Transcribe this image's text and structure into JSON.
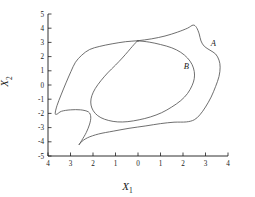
{
  "chart_data": {
    "type": "line",
    "title": "",
    "xlabel": "X1",
    "ylabel": "X2",
    "x_axis_label_text": "X",
    "x_axis_label_sub": "1",
    "y_axis_label_text": "X",
    "y_axis_label_sub": "2",
    "grid": false,
    "legend_position": "none",
    "xlim": [
      4,
      -4
    ],
    "ylim": [
      -5,
      5
    ],
    "x_reversed": true,
    "xticks": [
      4,
      3,
      2,
      1,
      0,
      1,
      2,
      3,
      4
    ],
    "xtick_values": [
      4,
      3,
      2,
      1,
      0,
      -1,
      -2,
      -3,
      -4
    ],
    "yticks": [
      5,
      4,
      3,
      2,
      1,
      0,
      -1,
      -2,
      -3,
      -4,
      -5
    ],
    "ytick_labels": [
      "5",
      "4",
      "3",
      "2",
      "1",
      "0",
      "-1",
      "-2",
      "-3",
      "-4",
      "-5"
    ],
    "line_color": "#555555",
    "axis_color": "#1a1a1a",
    "series": [
      {
        "name": "A",
        "label": "A",
        "label_x": -3.35,
        "label_y": 2.75,
        "closed": true,
        "points": [
          [
            0.0,
            3.12
          ],
          [
            -0.6,
            3.25
          ],
          [
            -1.2,
            3.45
          ],
          [
            -1.75,
            3.72
          ],
          [
            -2.2,
            4.0
          ],
          [
            -2.45,
            4.22
          ],
          [
            -2.6,
            4.05
          ],
          [
            -2.72,
            3.6
          ],
          [
            -2.8,
            3.1
          ],
          [
            -2.95,
            2.72
          ],
          [
            -3.2,
            2.45
          ],
          [
            -3.45,
            2.18
          ],
          [
            -3.6,
            1.75
          ],
          [
            -3.65,
            1.25
          ],
          [
            -3.6,
            0.6
          ],
          [
            -3.45,
            -0.1
          ],
          [
            -3.25,
            -0.85
          ],
          [
            -3.0,
            -1.55
          ],
          [
            -2.75,
            -2.1
          ],
          [
            -2.5,
            -2.45
          ],
          [
            -2.15,
            -2.6
          ],
          [
            -1.6,
            -2.62
          ],
          [
            -1.0,
            -2.72
          ],
          [
            -0.35,
            -2.88
          ],
          [
            0.4,
            -3.05
          ],
          [
            1.1,
            -3.25
          ],
          [
            1.75,
            -3.45
          ],
          [
            2.25,
            -3.72
          ],
          [
            2.55,
            -4.05
          ],
          [
            2.62,
            -4.22
          ],
          [
            2.5,
            -3.9
          ],
          [
            2.3,
            -3.35
          ],
          [
            2.15,
            -2.75
          ],
          [
            2.1,
            -2.25
          ],
          [
            2.2,
            -1.9
          ],
          [
            2.55,
            -1.75
          ],
          [
            3.0,
            -1.75
          ],
          [
            3.4,
            -1.85
          ],
          [
            3.6,
            -2.05
          ],
          [
            3.68,
            -2.0
          ],
          [
            3.6,
            -1.45
          ],
          [
            3.42,
            -0.7
          ],
          [
            3.2,
            0.15
          ],
          [
            2.98,
            0.95
          ],
          [
            2.78,
            1.6
          ],
          [
            2.5,
            2.1
          ],
          [
            2.15,
            2.5
          ],
          [
            1.7,
            2.72
          ],
          [
            1.15,
            2.9
          ],
          [
            0.55,
            3.05
          ],
          [
            0.0,
            3.12
          ]
        ]
      },
      {
        "name": "B",
        "label": "B",
        "label_x": -2.15,
        "label_y": 1.15,
        "closed": true,
        "tangent_point": [
          0.0,
          3.1
        ],
        "points": [
          [
            0.0,
            3.1
          ],
          [
            -0.5,
            3.02
          ],
          [
            -1.0,
            2.85
          ],
          [
            -1.5,
            2.62
          ],
          [
            -1.9,
            2.3
          ],
          [
            -2.2,
            1.9
          ],
          [
            -2.4,
            1.45
          ],
          [
            -2.5,
            0.95
          ],
          [
            -2.5,
            0.45
          ],
          [
            -2.4,
            -0.05
          ],
          [
            -2.2,
            -0.6
          ],
          [
            -1.9,
            -1.1
          ],
          [
            -1.5,
            -1.55
          ],
          [
            -1.05,
            -1.95
          ],
          [
            -0.55,
            -2.25
          ],
          [
            -0.05,
            -2.45
          ],
          [
            0.45,
            -2.58
          ],
          [
            0.9,
            -2.6
          ],
          [
            1.3,
            -2.5
          ],
          [
            1.65,
            -2.3
          ],
          [
            1.9,
            -2.0
          ],
          [
            2.05,
            -1.62
          ],
          [
            2.1,
            -1.2
          ],
          [
            2.05,
            -0.75
          ],
          [
            1.9,
            -0.25
          ],
          [
            1.65,
            0.3
          ],
          [
            1.35,
            0.85
          ],
          [
            1.0,
            1.4
          ],
          [
            0.7,
            1.9
          ],
          [
            0.45,
            2.35
          ],
          [
            0.25,
            2.72
          ],
          [
            0.1,
            2.98
          ],
          [
            0.0,
            3.1
          ]
        ]
      }
    ]
  }
}
